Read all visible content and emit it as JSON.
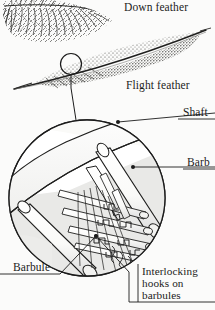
{
  "figure": {
    "width": 215,
    "height": 310,
    "background_color": "#fbfbfa",
    "ink_color": "#1b1b1b"
  },
  "labels": {
    "down_feather": "Down feather",
    "flight_feather": "Flight feather",
    "shaft": "Shaft",
    "barb": "Barb",
    "barbule": "Barbule",
    "interlocking_hooks_line1": "Interlocking",
    "interlocking_hooks_line2": "hooks on",
    "interlocking_hooks_line3": "barbules"
  },
  "illustrations": {
    "down_feather": {
      "name": "down-feather-drawing",
      "description": "Fuzzy plumulaceous down feather, dense fine branching barbs, upper left"
    },
    "flight_feather": {
      "name": "flight-feather-drawing",
      "description": "Long stippled pennaceous flight feather with central rachis, upper middle"
    },
    "magnifier_circle": {
      "name": "magnified-detail-circle",
      "description": "Large circular inset showing shaft, barbs, barbules and interlocking hooks"
    },
    "callout_circle": {
      "name": "callout-circle-on-vane",
      "description": "Small circle on the flight feather vane marking the magnified region"
    }
  },
  "leaders": {
    "callout_to_detail": "line from small circle on flight feather down to magnified circle",
    "shaft_leader": "dot inside circle to Shaft label",
    "barb_leader": "dot inside circle to Barb label",
    "barbule_leader": "dot inside circle to Barbule label",
    "hooks_leader": "dot inside circle down to Interlocking hooks on barbules label"
  }
}
